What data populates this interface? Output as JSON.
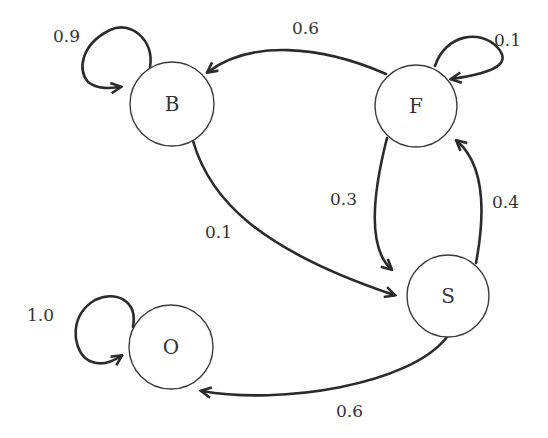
{
  "diagram": {
    "type": "state-transition-graph",
    "colors": {
      "background": "#ffffff",
      "stroke": "#2b2b2b",
      "text": "#333333"
    },
    "nodes": [
      {
        "id": "B",
        "label": "B",
        "cx": 172,
        "cy": 104,
        "r": 42
      },
      {
        "id": "F",
        "label": "F",
        "cx": 416,
        "cy": 106,
        "r": 41
      },
      {
        "id": "S",
        "label": "S",
        "cx": 448,
        "cy": 296,
        "r": 41
      },
      {
        "id": "O",
        "label": "O",
        "cx": 171,
        "cy": 347,
        "r": 42
      }
    ],
    "edges": [
      {
        "from": "B",
        "to": "B",
        "label": "0.9"
      },
      {
        "from": "F",
        "to": "B",
        "label": "0.6"
      },
      {
        "from": "F",
        "to": "F",
        "label": "0.1"
      },
      {
        "from": "B",
        "to": "S",
        "label": "0.1"
      },
      {
        "from": "F",
        "to": "S",
        "label": "0.3"
      },
      {
        "from": "S",
        "to": "F",
        "label": "0.4"
      },
      {
        "from": "O",
        "to": "O",
        "label": "1.0"
      },
      {
        "from": "S",
        "to": "O",
        "label": "0.6"
      }
    ]
  }
}
